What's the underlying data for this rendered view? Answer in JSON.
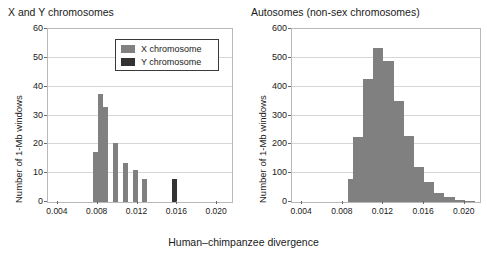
{
  "figure": {
    "xlabel": "Human–chimpanzee divergence",
    "colors": {
      "x_chromosome": "#808080",
      "y_chromosome": "#333333",
      "grid": "#d7d7d7",
      "frame": "#b9b9b9",
      "text": "#1a1a1a"
    }
  },
  "legend": {
    "position": "top-right-inside-left-panel",
    "entries": [
      {
        "label": "X chromosome",
        "color": "#808080"
      },
      {
        "label": "Y chromosome",
        "color": "#333333"
      }
    ]
  },
  "chart_data": [
    {
      "type": "bar",
      "id": "sex-chromosomes",
      "title": "X and Y chromosomes",
      "xlabel": "Human–chimpanzee divergence",
      "ylabel": "Number of 1-Mb windows",
      "xlim": [
        0.003,
        0.0215
      ],
      "ylim": [
        0,
        60
      ],
      "yticks": [
        0,
        10,
        20,
        30,
        40,
        50,
        60
      ],
      "xticks": [
        0.004,
        0.008,
        0.012,
        0.016,
        0.02
      ],
      "grid": true,
      "bin_width": 0.0005,
      "series": [
        {
          "name": "X chromosome",
          "color": "#808080",
          "bin_starts": [
            0.007,
            0.0075,
            0.008,
            0.0085,
            0.009,
            0.0095,
            0.01,
            0.0105,
            0.011,
            0.0115,
            0.012,
            0.0125
          ],
          "values": [
            0,
            17.5,
            37.5,
            33,
            0,
            20.5,
            0,
            13.5,
            0,
            11,
            0,
            8
          ]
        },
        {
          "name": "Y chromosome",
          "color": "#333333",
          "bin_starts": [
            0.0155
          ],
          "values": [
            8
          ]
        }
      ]
    },
    {
      "type": "bar",
      "id": "autosomes",
      "title": "Autosomes (non-sex chromosomes)",
      "xlabel": "Human–chimpanzee divergence",
      "ylabel": "Number of 1-Mb windows",
      "xlim": [
        0.003,
        0.0215
      ],
      "ylim": [
        0,
        600
      ],
      "yticks": [
        0,
        100,
        200,
        300,
        400,
        500,
        600
      ],
      "xticks": [
        0.004,
        0.008,
        0.012,
        0.016,
        0.02
      ],
      "grid": true,
      "bin_width": 0.0005,
      "series": [
        {
          "name": "Autosomes",
          "color": "#808080",
          "bin_starts": [
            0.0085,
            0.009,
            0.0095,
            0.01,
            0.0105,
            0.011,
            0.0115,
            0.012,
            0.0125,
            0.013,
            0.0135,
            0.014,
            0.0145,
            0.015,
            0.0155,
            0.016,
            0.0165,
            0.017,
            0.0175,
            0.018,
            0.0185,
            0.019,
            0.0195,
            0.02,
            0.0205
          ],
          "values": [
            80,
            225,
            225,
            425,
            425,
            535,
            535,
            490,
            490,
            352,
            352,
            230,
            230,
            122,
            122,
            70,
            70,
            33,
            33,
            17,
            17,
            8,
            8,
            5,
            5
          ]
        }
      ]
    }
  ]
}
